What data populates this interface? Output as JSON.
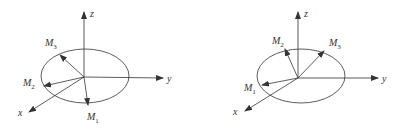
{
  "diagrams": [
    {
      "id": "left",
      "axes": {
        "x": "x",
        "y": "y",
        "z": "z"
      },
      "vectors": [
        {
          "name": "M",
          "sub": "1"
        },
        {
          "name": "M",
          "sub": "2"
        },
        {
          "name": "M",
          "sub": "3"
        }
      ]
    },
    {
      "id": "right",
      "axes": {
        "x": "x",
        "y": "y",
        "z": "z"
      },
      "vectors": [
        {
          "name": "M",
          "sub": "1"
        },
        {
          "name": "M",
          "sub": "2"
        },
        {
          "name": "M",
          "sub": "3"
        }
      ]
    }
  ],
  "colors": {
    "stroke": "#333333"
  }
}
